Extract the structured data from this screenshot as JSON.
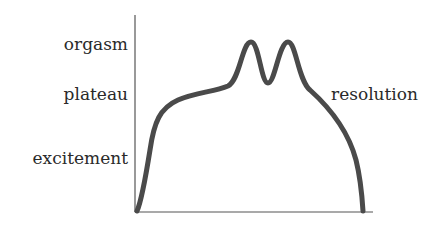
{
  "diagram": {
    "type": "response-cycle-curve",
    "y_axis_labels": [
      {
        "id": "orgasm",
        "text": "orgasm"
      },
      {
        "id": "plateau",
        "text": "plateau"
      },
      {
        "id": "excitement",
        "text": "excitement"
      }
    ],
    "right_label": {
      "id": "resolution",
      "text": "resolution"
    },
    "colors": {
      "curve": "#4a4a4a",
      "axis": "#555555",
      "text": "#2a2a2a",
      "background": "#ffffff"
    },
    "curve_points": [
      [
        137,
        211
      ],
      [
        145,
        185
      ],
      [
        152,
        140
      ],
      [
        160,
        112
      ],
      [
        175,
        100
      ],
      [
        200,
        94
      ],
      [
        225,
        88
      ],
      [
        238,
        78
      ],
      [
        244,
        55
      ],
      [
        251,
        42
      ],
      [
        258,
        55
      ],
      [
        263,
        78
      ],
      [
        268,
        83
      ],
      [
        273,
        78
      ],
      [
        279,
        55
      ],
      [
        288,
        42
      ],
      [
        295,
        55
      ],
      [
        302,
        80
      ],
      [
        320,
        98
      ],
      [
        340,
        125
      ],
      [
        355,
        160
      ],
      [
        361,
        190
      ],
      [
        363,
        211
      ]
    ],
    "axes": {
      "y_axis": {
        "x": 135,
        "y_top": 15,
        "y_bottom": 212
      },
      "x_axis": {
        "y": 212,
        "x_left": 135,
        "x_right": 373
      }
    }
  }
}
